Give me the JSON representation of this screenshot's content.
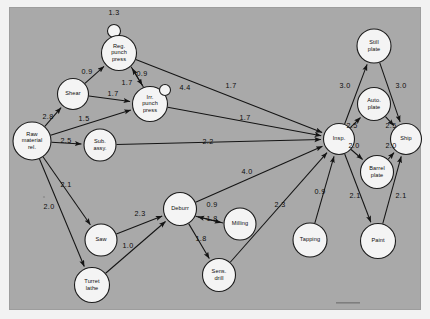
{
  "figure": {
    "type": "network-diagram",
    "background_color": "#a9a9a9",
    "page_color": "#ffffff",
    "node_fill": "#f4f4f4",
    "line_color": "#141414"
  },
  "chart_data": {
    "type": "diagram",
    "title": "",
    "xlabel": "",
    "ylabel": "",
    "nodes": [
      {
        "id": "reg_loop",
        "label": "",
        "x": 114,
        "y": 31,
        "r": 6.5,
        "kind": "loop"
      },
      {
        "id": "reg",
        "label": "Reg. punch press",
        "x": 119,
        "y": 53,
        "r": 17.5,
        "kind": "process"
      },
      {
        "id": "shear",
        "label": "Shear",
        "x": 73,
        "y": 94,
        "r": 15.5,
        "kind": "process"
      },
      {
        "id": "irr",
        "label": "Irr. punch press",
        "x": 150,
        "y": 104,
        "r": 17.5,
        "kind": "process"
      },
      {
        "id": "irr_loop",
        "label": "",
        "x": 165,
        "y": 90,
        "r": 5.5,
        "kind": "loop"
      },
      {
        "id": "raw",
        "label": "Raw material rel.",
        "x": 32,
        "y": 141,
        "r": 19.0,
        "kind": "process"
      },
      {
        "id": "sub",
        "label": "Sub. assy.",
        "x": 100,
        "y": 145,
        "r": 16.0,
        "kind": "process"
      },
      {
        "id": "insp",
        "label": "Insp.",
        "x": 339,
        "y": 139,
        "r": 15.5,
        "kind": "process"
      },
      {
        "id": "still",
        "label": "Still plate",
        "x": 374,
        "y": 46,
        "r": 17.0,
        "kind": "process"
      },
      {
        "id": "auto",
        "label": "Auto. plate",
        "x": 374,
        "y": 104,
        "r": 16.5,
        "kind": "process"
      },
      {
        "id": "ship",
        "label": "Ship",
        "x": 406,
        "y": 139,
        "r": 15.5,
        "kind": "process"
      },
      {
        "id": "barrel",
        "label": "Barrel plate",
        "x": 377,
        "y": 172,
        "r": 16.5,
        "kind": "process"
      },
      {
        "id": "deburr",
        "label": "Deburr",
        "x": 180,
        "y": 209,
        "r": 16.5,
        "kind": "process"
      },
      {
        "id": "milling",
        "label": "Milling",
        "x": 240,
        "y": 224,
        "r": 16.0,
        "kind": "process"
      },
      {
        "id": "saw",
        "label": "Saw",
        "x": 101,
        "y": 240,
        "r": 16.0,
        "kind": "process"
      },
      {
        "id": "sens",
        "label": "Sens. drill",
        "x": 219,
        "y": 275,
        "r": 16.5,
        "kind": "process"
      },
      {
        "id": "tapping",
        "label": "Tapping",
        "x": 310,
        "y": 240,
        "r": 17.0,
        "kind": "process"
      },
      {
        "id": "paint",
        "label": "Paint",
        "x": 378,
        "y": 241,
        "r": 17.5,
        "kind": "process"
      },
      {
        "id": "turret",
        "label": "Turret lathe",
        "x": 92,
        "y": 285,
        "r": 17.5,
        "kind": "process"
      }
    ],
    "edges": [
      {
        "from": "reg",
        "to": "reg",
        "value": "1.3",
        "label_x": 114,
        "label_y": 13,
        "self_loop": true
      },
      {
        "from": "irr",
        "to": "irr",
        "value": "4.4",
        "label_x": 185,
        "label_y": 88,
        "self_loop": true
      },
      {
        "from": "shear",
        "to": "reg",
        "value": "0.9",
        "label_x": 87,
        "label_y": 72
      },
      {
        "from": "shear",
        "to": "irr",
        "value": "1.7",
        "label_x": 113,
        "label_y": 94
      },
      {
        "from": "reg",
        "to": "irr",
        "value": "1.7",
        "label_x": 127,
        "label_y": 83
      },
      {
        "from": "irr",
        "to": "reg",
        "value": "0.9",
        "label_x": 142,
        "label_y": 74
      },
      {
        "from": "raw",
        "to": "shear",
        "value": "2.8",
        "label_x": 48,
        "label_y": 117
      },
      {
        "from": "raw",
        "to": "irr",
        "value": "1.5",
        "label_x": 84,
        "label_y": 119
      },
      {
        "from": "raw",
        "to": "sub",
        "value": "2.5",
        "label_x": 66,
        "label_y": 141
      },
      {
        "from": "raw",
        "to": "saw",
        "value": "2.1",
        "label_x": 66,
        "label_y": 185
      },
      {
        "from": "raw",
        "to": "turret",
        "value": "2.0",
        "label_x": 49,
        "label_y": 207
      },
      {
        "from": "reg",
        "to": "insp",
        "value": "1.7",
        "label_x": 231,
        "label_y": 86
      },
      {
        "from": "irr",
        "to": "insp",
        "value": "1.7",
        "label_x": 245,
        "label_y": 118
      },
      {
        "from": "sub",
        "to": "insp",
        "value": "2.2",
        "label_x": 208,
        "label_y": 142
      },
      {
        "from": "insp",
        "to": "still",
        "value": "3.0",
        "label_x": 345,
        "label_y": 86
      },
      {
        "from": "still",
        "to": "ship",
        "value": "3.0",
        "label_x": 401,
        "label_y": 86
      },
      {
        "from": "insp",
        "to": "auto",
        "value": "2.5",
        "label_x": 352,
        "label_y": 126
      },
      {
        "from": "auto",
        "to": "ship",
        "value": "2.5",
        "label_x": 391,
        "label_y": 126
      },
      {
        "from": "insp",
        "to": "barrel",
        "value": "2.0",
        "label_x": 354,
        "label_y": 146
      },
      {
        "from": "barrel",
        "to": "ship",
        "value": "2.0",
        "label_x": 391,
        "label_y": 146
      },
      {
        "from": "insp",
        "to": "paint",
        "value": "2.1",
        "label_x": 355,
        "label_y": 196
      },
      {
        "from": "paint",
        "to": "ship",
        "value": "2.1",
        "label_x": 401,
        "label_y": 196
      },
      {
        "from": "deburr",
        "to": "insp",
        "value": "4.0",
        "label_x": 247,
        "label_y": 172
      },
      {
        "from": "sens",
        "to": "insp",
        "value": "2.3",
        "label_x": 280,
        "label_y": 205
      },
      {
        "from": "tapping",
        "to": "insp",
        "value": "0.9",
        "label_x": 320,
        "label_y": 192
      },
      {
        "from": "saw",
        "to": "deburr",
        "value": "2.3",
        "label_x": 140,
        "label_y": 214
      },
      {
        "from": "turret",
        "to": "deburr",
        "value": "1.0",
        "label_x": 128,
        "label_y": 246
      },
      {
        "from": "deburr",
        "to": "milling",
        "value": "0.9",
        "label_x": 212,
        "label_y": 205
      },
      {
        "from": "milling",
        "to": "deburr",
        "value": "1.8",
        "label_x": 212,
        "label_y": 219
      },
      {
        "from": "deburr",
        "to": "sens",
        "value": "1.8",
        "label_x": 201,
        "label_y": 239
      }
    ]
  }
}
